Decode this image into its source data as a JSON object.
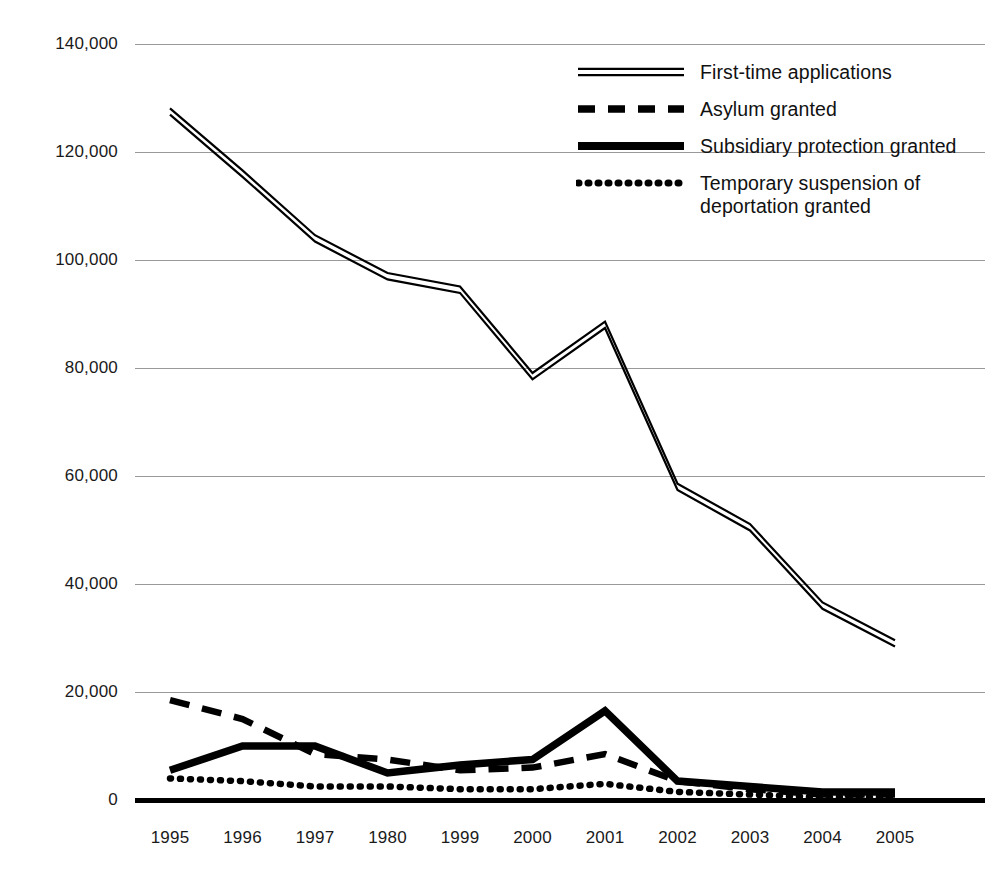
{
  "chart_data": {
    "type": "line",
    "title": "",
    "xlabel": "",
    "ylabel": "",
    "ylim": [
      0,
      140000
    ],
    "ytick_step": 20000,
    "grid": true,
    "legend_position": "top-right",
    "categories": [
      "1995",
      "1996",
      "1997",
      "1980",
      "1999",
      "2000",
      "2001",
      "2002",
      "2003",
      "2004",
      "2005"
    ],
    "ytick_labels": [
      "140,000",
      "120,000",
      "100,000",
      "80,000",
      "60,000",
      "40,000",
      "20,000",
      "0"
    ],
    "ytick_values": [
      140000,
      120000,
      100000,
      80000,
      60000,
      40000,
      20000,
      0
    ],
    "series": [
      {
        "name": "First-time applications",
        "style": "double-thin-line",
        "values": [
          127500,
          116000,
          104000,
          97000,
          94500,
          78500,
          88000,
          58000,
          50500,
          36000,
          29000
        ]
      },
      {
        "name": "Asylum granted",
        "style": "dashed",
        "values": [
          18500,
          15000,
          8500,
          7500,
          5500,
          6000,
          8500,
          3500,
          2000,
          1000,
          1000
        ]
      },
      {
        "name": "Subsidiary protection granted",
        "style": "thick-solid",
        "values": [
          5500,
          10000,
          10000,
          5000,
          6500,
          7500,
          16500,
          3500,
          2500,
          1500,
          1500
        ]
      },
      {
        "name": "Temporary suspension of deportation granted",
        "style": "dotted",
        "values": [
          4000,
          3500,
          2500,
          2500,
          2000,
          2000,
          3000,
          1500,
          1000,
          500,
          500
        ]
      }
    ]
  },
  "legend": {
    "items": [
      {
        "label": "First-time applications",
        "style": "double-thin-line"
      },
      {
        "label": "Asylum granted",
        "style": "dashed"
      },
      {
        "label": "Subsidiary protection granted",
        "style": "thick-solid"
      },
      {
        "label": "Temporary suspension of deportation granted",
        "style": "dotted"
      }
    ]
  },
  "colors": {
    "line": "#000000",
    "grid": "#999999",
    "axis": "#000000",
    "text": "#111111",
    "background": "#ffffff"
  }
}
